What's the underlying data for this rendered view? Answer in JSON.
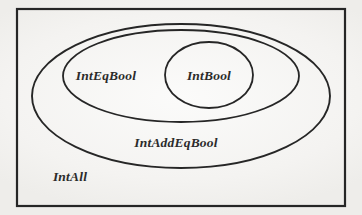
{
  "figure": {
    "type": "euler-diagram",
    "background_color": "#f6f5f3",
    "line_color": "#262626",
    "text_color": "#2b2b2b"
  },
  "frame": {
    "name": "outer-rectangle",
    "x": 17,
    "y": 9,
    "width": 328,
    "height": 197,
    "stroke_width": 2.2
  },
  "sets": [
    {
      "id": "intall",
      "label": "IntAll",
      "shape": "rectangle",
      "label_x": 70,
      "label_y": 181,
      "font_size": 13.5,
      "anchor": "middle"
    },
    {
      "id": "intaddeqbool",
      "label": "IntAddEqBool",
      "shape": "ellipse",
      "cx": 181,
      "cy": 96,
      "rx": 149,
      "ry": 72,
      "stroke_width": 1.9,
      "label_x": 176,
      "label_y": 147,
      "font_size": 13.5,
      "anchor": "middle"
    },
    {
      "id": "inteqbool",
      "label": "IntEqBool",
      "shape": "ellipse",
      "cx": 181,
      "cy": 76,
      "rx": 118,
      "ry": 46,
      "stroke_width": 1.8,
      "label_x": 106,
      "label_y": 80,
      "font_size": 13.5,
      "anchor": "middle"
    },
    {
      "id": "intbool",
      "label": "IntBool",
      "shape": "ellipse",
      "cx": 209,
      "cy": 75,
      "rx": 44,
      "ry": 33,
      "stroke_width": 1.8,
      "label_x": 209,
      "label_y": 80,
      "font_size": 13.5,
      "anchor": "middle"
    }
  ]
}
